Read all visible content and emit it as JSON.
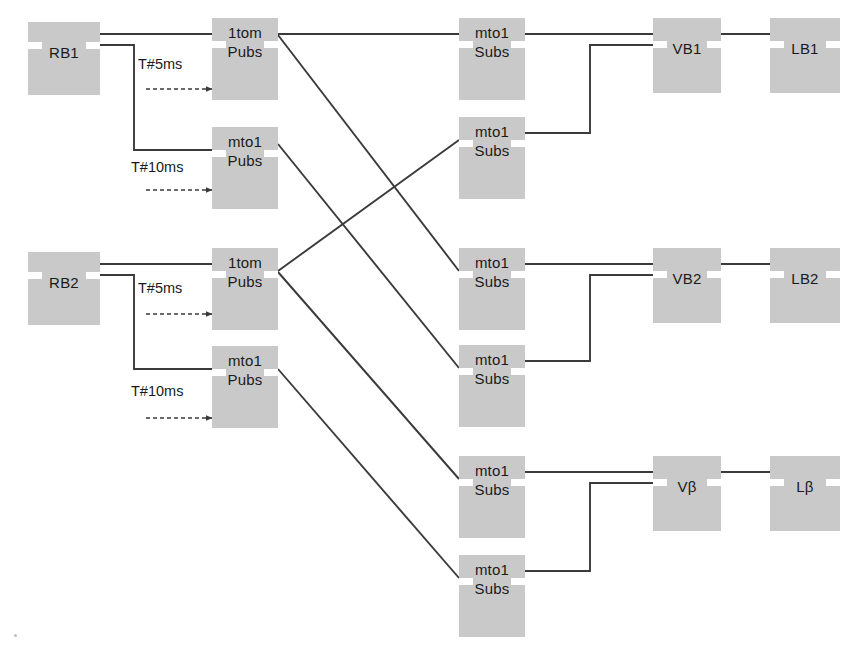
{
  "diagram": {
    "background_color": "#ffffff",
    "block_fill": "#c9c9c9",
    "notch_color": "#ffffff",
    "wire_color": "#3a3a3a",
    "text_color": "#1a1a1a",
    "canvas": {
      "width": 859,
      "height": 662
    }
  },
  "blocks": [
    {
      "id": "rb1",
      "label_top": "RB1",
      "label_bottom": "",
      "x": 28,
      "y": 22,
      "w": 72,
      "h": 73,
      "notch_y": 20,
      "lines": 1
    },
    {
      "id": "rb2",
      "label_top": "RB2",
      "label_bottom": "",
      "x": 28,
      "y": 252,
      "w": 72,
      "h": 73,
      "notch_y": 20,
      "lines": 1
    },
    {
      "id": "pub1tom_1",
      "label_top": "1tom",
      "label_bottom": "Pubs",
      "x": 212,
      "y": 18,
      "w": 66,
      "h": 82,
      "notch_y": 23,
      "lines": 2
    },
    {
      "id": "pubmto1_1",
      "label_top": "mto1",
      "label_bottom": "Pubs",
      "x": 212,
      "y": 127,
      "w": 66,
      "h": 82,
      "notch_y": 23,
      "lines": 2
    },
    {
      "id": "pub1tom_2",
      "label_top": "1tom",
      "label_bottom": "Pubs",
      "x": 212,
      "y": 248,
      "w": 66,
      "h": 82,
      "notch_y": 23,
      "lines": 2
    },
    {
      "id": "pubmto1_2",
      "label_top": "mto1",
      "label_bottom": "Pubs",
      "x": 212,
      "y": 346,
      "w": 66,
      "h": 82,
      "notch_y": 23,
      "lines": 2
    },
    {
      "id": "sub1",
      "label_top": "mto1",
      "label_bottom": "Subs",
      "x": 459,
      "y": 18,
      "w": 66,
      "h": 82,
      "notch_y": 23,
      "lines": 2
    },
    {
      "id": "sub2",
      "label_top": "mto1",
      "label_bottom": "Subs",
      "x": 459,
      "y": 117,
      "w": 66,
      "h": 82,
      "notch_y": 23,
      "lines": 2
    },
    {
      "id": "sub3",
      "label_top": "mto1",
      "label_bottom": "Subs",
      "x": 459,
      "y": 248,
      "w": 66,
      "h": 82,
      "notch_y": 23,
      "lines": 2
    },
    {
      "id": "sub4",
      "label_top": "mto1",
      "label_bottom": "Subs",
      "x": 459,
      "y": 345,
      "w": 66,
      "h": 82,
      "notch_y": 23,
      "lines": 2
    },
    {
      "id": "sub5",
      "label_top": "mto1",
      "label_bottom": "Subs",
      "x": 459,
      "y": 456,
      "w": 66,
      "h": 82,
      "notch_y": 23,
      "lines": 2
    },
    {
      "id": "sub6",
      "label_top": "mto1",
      "label_bottom": "Subs",
      "x": 459,
      "y": 555,
      "w": 66,
      "h": 82,
      "notch_y": 23,
      "lines": 2
    },
    {
      "id": "vb1",
      "label_top": "VB1",
      "label_bottom": "",
      "x": 653,
      "y": 18,
      "w": 68,
      "h": 75,
      "notch_y": 23,
      "lines": 1
    },
    {
      "id": "vb2",
      "label_top": "VB2",
      "label_bottom": "",
      "x": 653,
      "y": 248,
      "w": 68,
      "h": 75,
      "notch_y": 23,
      "lines": 1
    },
    {
      "id": "vbeta",
      "label_top": "Vβ",
      "label_bottom": "",
      "x": 653,
      "y": 456,
      "w": 68,
      "h": 75,
      "notch_y": 23,
      "lines": 1
    },
    {
      "id": "lb1",
      "label_top": "LB1",
      "label_bottom": "",
      "x": 770,
      "y": 18,
      "w": 70,
      "h": 75,
      "notch_y": 23,
      "lines": 1
    },
    {
      "id": "lb2",
      "label_top": "LB2",
      "label_bottom": "",
      "x": 770,
      "y": 248,
      "w": 70,
      "h": 75,
      "notch_y": 23,
      "lines": 1
    },
    {
      "id": "lbeta",
      "label_top": "Lβ",
      "label_bottom": "",
      "x": 770,
      "y": 456,
      "w": 70,
      "h": 75,
      "notch_y": 23,
      "lines": 1
    }
  ],
  "annotations": [
    {
      "id": "t5ms_1",
      "text": "T#5ms",
      "x": 138,
      "y": 56
    },
    {
      "id": "t10ms_1",
      "text": "T#10ms",
      "x": 131,
      "y": 159
    },
    {
      "id": "t5ms_2",
      "text": "T#5ms",
      "x": 138,
      "y": 280
    },
    {
      "id": "t10ms_2",
      "text": "T#10ms",
      "x": 131,
      "y": 383
    }
  ],
  "timer_arrows": [
    {
      "id": "arrow_t5ms_1",
      "x1": 146,
      "y1": 89,
      "x2": 212,
      "y2": 89
    },
    {
      "id": "arrow_t10ms_1",
      "x1": 146,
      "y1": 190,
      "x2": 212,
      "y2": 190
    },
    {
      "id": "arrow_t5ms_2",
      "x1": 146,
      "y1": 314,
      "x2": 212,
      "y2": 314
    },
    {
      "id": "arrow_t10ms_2",
      "x1": 146,
      "y1": 418,
      "x2": 212,
      "y2": 418
    }
  ],
  "wires": [
    {
      "id": "rb1-to-1tom1",
      "from": "rb1",
      "to": "pub1tom_1",
      "points": "100,34 212,34"
    },
    {
      "id": "rb1-to-mto1p1",
      "from": "rb1",
      "to": "pubmto1_1",
      "points": "100,45 134,45 134,150 212,150"
    },
    {
      "id": "rb2-to-1tom2",
      "from": "rb2",
      "to": "pub1tom_2",
      "points": "100,264 212,264"
    },
    {
      "id": "rb2-to-mto1p2",
      "from": "rb2",
      "to": "pubmto1_2",
      "points": "100,275 134,275 134,369 212,369"
    },
    {
      "id": "1tom1-to-sub1",
      "from": "pub1tom_1",
      "to": "sub1",
      "points": "278,34 459,34"
    },
    {
      "id": "1tom1-to-sub3",
      "from": "pub1tom_1",
      "to": "sub3",
      "points": "278,35 459,271"
    },
    {
      "id": "mto1p1-to-sub4",
      "from": "pubmto1_1",
      "to": "sub4",
      "points": "278,144 459,368"
    },
    {
      "id": "1tom2-to-sub2",
      "from": "pub1tom_2",
      "to": "sub2",
      "points": "278,271 459,140"
    },
    {
      "id": "1tom2-to-sub5",
      "from": "pub1tom_2",
      "to": "sub5",
      "points": "278,272 459,479"
    },
    {
      "id": "mto1p2-to-sub6",
      "from": "pubmto1_2",
      "to": "sub6",
      "points": "278,369 459,578"
    },
    {
      "id": "sub1-to-vb1",
      "from": "sub1",
      "to": "vb1",
      "points": "525,34 653,34"
    },
    {
      "id": "sub2-to-vb1",
      "from": "sub2",
      "to": "vb1",
      "points": "525,133 590,133 590,45 653,45"
    },
    {
      "id": "vb1-to-lb1",
      "from": "vb1",
      "to": "lb1",
      "points": "721,34 770,34"
    },
    {
      "id": "sub3-to-vb2",
      "from": "sub3",
      "to": "vb2",
      "points": "525,264 653,264"
    },
    {
      "id": "sub4-to-vb2",
      "from": "sub4",
      "to": "vb2",
      "points": "525,361 590,361 590,275 653,275"
    },
    {
      "id": "vb2-to-lb2",
      "from": "vb2",
      "to": "lb2",
      "points": "721,264 770,264"
    },
    {
      "id": "sub5-to-vbeta",
      "from": "sub5",
      "to": "vbeta",
      "points": "525,472 653,472"
    },
    {
      "id": "sub6-to-vbeta",
      "from": "sub6",
      "to": "vbeta",
      "points": "525,571 590,571 590,483 653,483"
    },
    {
      "id": "vbeta-to-lbeta",
      "from": "vbeta",
      "to": "lbeta",
      "points": "721,472 770,472"
    }
  ],
  "specks": [
    {
      "id": "speck-bottom-left",
      "x": 14,
      "y": 634
    }
  ]
}
